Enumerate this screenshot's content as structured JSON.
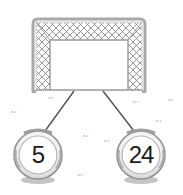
{
  "scene": {
    "description": "soccer goal connected to two numbered balls",
    "goal": {
      "icon": "soccer-goal-icon",
      "frame_color": "#a8a8a8",
      "net_color": "#8a8a8a"
    },
    "connector_color": "#444444",
    "balls": [
      {
        "label": "5",
        "icon": "soccer-ball-icon"
      },
      {
        "label": "24",
        "icon": "soccer-ball-icon"
      }
    ],
    "grass_color": "#9a9a9a"
  }
}
